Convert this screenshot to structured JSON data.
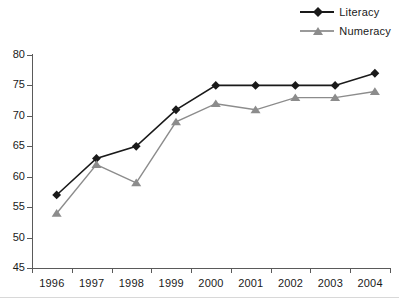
{
  "chart_data": {
    "type": "line",
    "title": "",
    "xlabel": "",
    "ylabel": "",
    "categories": [
      "1996",
      "1997",
      "1998",
      "1999",
      "2000",
      "2001",
      "2002",
      "2003",
      "2004"
    ],
    "series": [
      {
        "name": "Literacy",
        "values": [
          57,
          63,
          65,
          71,
          75,
          75,
          75,
          75,
          77
        ],
        "color": "#1a1a1a",
        "marker": "diamond"
      },
      {
        "name": "Numeracy",
        "values": [
          54,
          62,
          59,
          69,
          72,
          71,
          73,
          73,
          74
        ],
        "color": "#8c8c8c",
        "marker": "triangle"
      }
    ],
    "ylim": [
      45,
      80
    ],
    "ytick_step": 5,
    "yticks": [
      "80",
      "75",
      "70",
      "65",
      "60",
      "55",
      "50",
      "45"
    ],
    "grid": false,
    "legend_position": "top-right"
  },
  "legend": {
    "entries": [
      {
        "label": "Literacy",
        "marker_icon": "diamond-marker-icon"
      },
      {
        "label": "Numeracy",
        "marker_icon": "triangle-marker-icon"
      }
    ]
  },
  "colors": {
    "literacy": "#1a1a1a",
    "numeracy": "#8c8c8c",
    "axis": "#5a5a5a",
    "background": "#ffffff"
  }
}
